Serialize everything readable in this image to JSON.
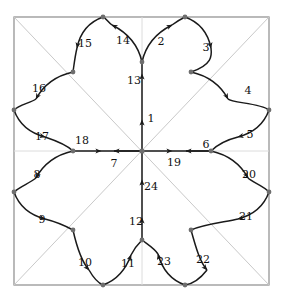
{
  "figure": {
    "type": "geometric-diagram",
    "background_color": "#ffffff",
    "stroke_color": "#1a1a1a",
    "frame_color": "#8c8c8c",
    "diagonal_color": "#c9c9c9",
    "axis_color": "#d8d8d8",
    "vertex_color": "#6e6e6e"
  },
  "frame": {
    "left": 14,
    "top": 17,
    "right": 269,
    "bottom": 285,
    "center_x": 142,
    "center_y": 151
  },
  "chart_data": {
    "type": "scatter",
    "title": "",
    "xlabel": "",
    "ylabel": "",
    "arc_count": 24,
    "labels": [
      "1",
      "2",
      "3",
      "4",
      "5",
      "6",
      "7",
      "8",
      "9",
      "10",
      "11",
      "12",
      "13",
      "14",
      "15",
      "16",
      "17",
      "18",
      "19",
      "20",
      "21",
      "22",
      "23",
      "24"
    ]
  },
  "arc_labels": [
    {
      "id": "1",
      "text": "1",
      "x": 151,
      "y": 118
    },
    {
      "id": "2",
      "text": "2",
      "x": 161,
      "y": 41
    },
    {
      "id": "3",
      "text": "3",
      "x": 206,
      "y": 47
    },
    {
      "id": "4",
      "text": "4",
      "x": 248,
      "y": 90
    },
    {
      "id": "5",
      "text": "5",
      "x": 250,
      "y": 134
    },
    {
      "id": "6",
      "text": "6",
      "x": 206,
      "y": 144
    },
    {
      "id": "7",
      "text": "7",
      "x": 114,
      "y": 163
    },
    {
      "id": "8",
      "text": "8",
      "x": 37,
      "y": 174
    },
    {
      "id": "9",
      "text": "9",
      "x": 42,
      "y": 219
    },
    {
      "id": "10",
      "text": "10",
      "x": 85,
      "y": 262
    },
    {
      "id": "11",
      "text": "11",
      "x": 128,
      "y": 263
    },
    {
      "id": "12",
      "text": "12",
      "x": 136,
      "y": 221
    },
    {
      "id": "13",
      "text": "13",
      "x": 134,
      "y": 80
    },
    {
      "id": "14",
      "text": "14",
      "x": 123,
      "y": 40
    },
    {
      "id": "15",
      "text": "15",
      "x": 85,
      "y": 43
    },
    {
      "id": "16",
      "text": "16",
      "x": 39,
      "y": 88
    },
    {
      "id": "17",
      "text": "17",
      "x": 42,
      "y": 136
    },
    {
      "id": "18",
      "text": "18",
      "x": 82,
      "y": 140
    },
    {
      "id": "19",
      "text": "19",
      "x": 174,
      "y": 162
    },
    {
      "id": "20",
      "text": "20",
      "x": 249,
      "y": 174
    },
    {
      "id": "21",
      "text": "21",
      "x": 246,
      "y": 216
    },
    {
      "id": "22",
      "text": "22",
      "x": 203,
      "y": 259
    },
    {
      "id": "23",
      "text": "23",
      "x": 164,
      "y": 261
    },
    {
      "id": "24",
      "text": "24",
      "x": 151,
      "y": 186
    }
  ],
  "vertices": [
    {
      "name": "center",
      "x": 142,
      "y": 151
    },
    {
      "name": "top-cusp",
      "x": 142,
      "y": 62
    },
    {
      "name": "bottom-cusp",
      "x": 142,
      "y": 240
    },
    {
      "name": "left-cusp",
      "x": 73,
      "y": 151
    },
    {
      "name": "right-cusp",
      "x": 211,
      "y": 151
    },
    {
      "name": "cusp-ne",
      "x": 191,
      "y": 72
    },
    {
      "name": "cusp-nw",
      "x": 73,
      "y": 72
    },
    {
      "name": "cusp-se",
      "x": 191,
      "y": 230
    },
    {
      "name": "cusp-sw",
      "x": 73,
      "y": 230
    },
    {
      "name": "tip-top-left",
      "x": 103,
      "y": 17
    },
    {
      "name": "tip-top-right",
      "x": 185,
      "y": 17
    },
    {
      "name": "tip-bot-left",
      "x": 103,
      "y": 285
    },
    {
      "name": "tip-bot-right",
      "x": 185,
      "y": 285
    },
    {
      "name": "tip-left-top",
      "x": 14,
      "y": 110
    },
    {
      "name": "tip-left-bot",
      "x": 14,
      "y": 192
    },
    {
      "name": "tip-right-top",
      "x": 269,
      "y": 110
    },
    {
      "name": "tip-right-bot",
      "x": 269,
      "y": 192
    }
  ]
}
